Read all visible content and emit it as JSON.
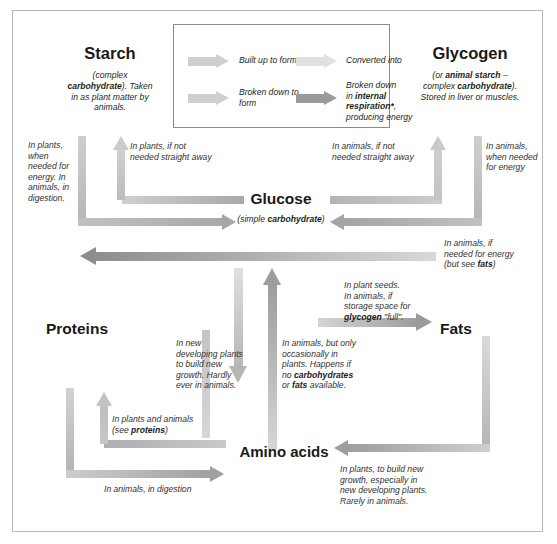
{
  "diagram": {
    "title_hidden": "Metabolic conversions between carbohydrates, fats and proteins"
  },
  "legend": {
    "items": [
      {
        "label": "Built up to form",
        "tone": "light"
      },
      {
        "label": "Converted into",
        "tone": "lighter"
      },
      {
        "label": "Broken down to form",
        "tone": "light"
      },
      {
        "label": "Broken down in internal respiration*, producing energy",
        "tone": "dark",
        "rich": true,
        "line1": "Broken down",
        "line2_pre": "in ",
        "line2_bold": "internal",
        "line3_bold": "respiration*",
        "line3_post": ",",
        "line4": "producing energy"
      }
    ]
  },
  "nodes": {
    "starch": {
      "title": "Starch",
      "sub_line1_pre": "(complex",
      "sub_line2_bold": "carbohydrate",
      "sub_line2_post": "). Taken",
      "sub_line3": "in as plant matter by",
      "sub_line4": "animals."
    },
    "glycogen": {
      "title": "Glycogen",
      "sub_line1_pre": "(or ",
      "sub_line1_bold": "animal starch",
      "sub_line1_post": " –",
      "sub_line2_pre": "complex ",
      "sub_line2_bold": "carbohydrate",
      "sub_line2_post": ").",
      "sub_line3": "Stored in liver or muscles."
    },
    "glucose": {
      "title": "Glucose",
      "sub_pre": "(simple ",
      "sub_bold": "carbohydrate",
      "sub_post": ")"
    },
    "proteins": {
      "title": "Proteins"
    },
    "fats": {
      "title": "Fats"
    },
    "amino_acids": {
      "title": "Amino acids"
    }
  },
  "annotations": {
    "starch_to_glucose_left": "In plants,\nwhen\nneeded for\nenergy. In\nanimals, in\ndigestion.",
    "glucose_to_starch": "In plants, if not\nneeded straight away",
    "glucose_to_glycogen": "In animals, if not\nneeded straight away",
    "glycogen_to_glucose": "In animals,\nwhen needed\nfor energy",
    "glucose_to_fats_right": "In animals, if\nneeded for energy\n(but see fats)",
    "glucose_to_fats": "In plant seeds.\nIn animals, if\nstorage space for\nglycogen \"full\".",
    "amino_to_proteins": "In new\ndeveloping plants\nto build new\ngrowth. Hardly\never in animals.",
    "amino_to_glucose": "In animals, but only\noccasionally in\nplants. Happens if\nno carbohydrates\nor fats available.",
    "proteins_amino_note": "In plants and animals\n(see proteins)",
    "proteins_to_amino": "In animals, in digestion",
    "fats_to_amino": "In plants, to build new\ngrowth, especially in\nnew developing plants.\nRarely in animals."
  },
  "annotation_bold_terms": {
    "fats": "fats",
    "glycogen": "glycogen",
    "proteins": "proteins",
    "carbohydrates": "carbohydrates"
  },
  "colors": {
    "arrow_light": "#c9c9c9",
    "arrow_mid": "#b0b0b0",
    "arrow_dark": "#8f8f8f",
    "arrow_lighter": "#dcdcdc",
    "frame": "#b9b9b9",
    "text": "#231f20",
    "text_soft": "#333031"
  }
}
